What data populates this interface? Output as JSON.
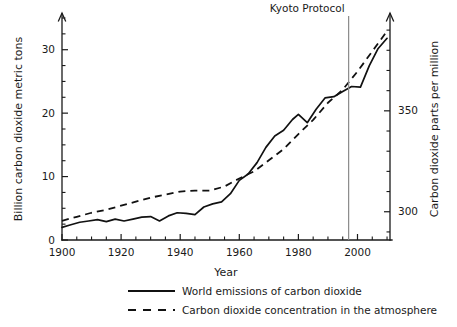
{
  "chart_data": {
    "type": "line",
    "title": "",
    "xlabel": "Year",
    "ylabel": "Billion carbon dioxide metric tons",
    "y2label": "Carbon dioxide parts per million",
    "xlim": [
      1900,
      2011
    ],
    "ylim": [
      0,
      35
    ],
    "y2lim": [
      286,
      396
    ],
    "grid": false,
    "legend_position": "below",
    "x_ticks": [
      1900,
      1920,
      1940,
      1960,
      1980,
      2000
    ],
    "x_tick_labels": [
      "1900",
      "1920",
      "1940",
      "1960",
      "1980",
      "2000"
    ],
    "x_minor_step": 5,
    "y_ticks": [
      0,
      10,
      20,
      30
    ],
    "y_tick_labels": [
      "0",
      "10",
      "20",
      "30"
    ],
    "y_minor_step": 2.5,
    "y2_ticks": [
      300,
      350
    ],
    "y2_tick_labels": [
      "300",
      "350"
    ],
    "y2_minor_step": 10,
    "annotations": [
      {
        "label": "Kyoto Protocol",
        "x": 1997,
        "type": "vertical-line"
      }
    ],
    "series": [
      {
        "name": "World emissions of carbon dioxide",
        "style": "solid",
        "axis": "left",
        "units": "billion metric tons",
        "x": [
          1900,
          1903,
          1906,
          1909,
          1912,
          1915,
          1918,
          1921,
          1924,
          1927,
          1930,
          1933,
          1936,
          1939,
          1942,
          1945,
          1948,
          1951,
          1954,
          1957,
          1960,
          1963,
          1966,
          1969,
          1972,
          1975,
          1978,
          1980,
          1983,
          1986,
          1989,
          1992,
          1995,
          1998,
          2001,
          2004,
          2007,
          2010
        ],
        "values": [
          2.0,
          2.4,
          2.8,
          3.0,
          3.2,
          2.9,
          3.3,
          3.0,
          3.3,
          3.6,
          3.7,
          3.0,
          3.8,
          4.3,
          4.2,
          4.0,
          5.2,
          5.7,
          6.0,
          7.3,
          9.4,
          10.4,
          12.2,
          14.6,
          16.4,
          17.3,
          19.0,
          19.8,
          18.5,
          20.6,
          22.4,
          22.6,
          23.4,
          24.2,
          24.1,
          27.5,
          30.2,
          31.8
        ],
        "notable_points": [
          {
            "x": 1900,
            "y": 2.0,
            "note": "series start"
          },
          {
            "x": 1932,
            "y": 2.9,
            "note": "Great Depression dip"
          },
          {
            "x": 1945,
            "y": 4.0,
            "note": "end of WWII dip"
          },
          {
            "x": 1980,
            "y": 19.8,
            "note": "local peak"
          },
          {
            "x": 1983,
            "y": 18.5,
            "note": "early-1980s dip"
          },
          {
            "x": 2010,
            "y": 31.8,
            "note": "series end"
          }
        ]
      },
      {
        "name": "Carbon dioxide concentration in the atmosphere",
        "style": "dashed",
        "axis": "right",
        "units": "parts per million",
        "x": [
          1900,
          1905,
          1910,
          1915,
          1920,
          1925,
          1930,
          1935,
          1940,
          1945,
          1950,
          1955,
          1960,
          1965,
          1970,
          1975,
          1980,
          1985,
          1990,
          1995,
          2000,
          2005,
          2010
        ],
        "values": [
          295.5,
          297.5,
          299.5,
          301.0,
          303.0,
          305.0,
          307.0,
          308.5,
          310.0,
          310.5,
          310.5,
          312.5,
          316.5,
          320.0,
          325.5,
          331.0,
          338.5,
          345.5,
          354.0,
          360.5,
          369.5,
          379.5,
          389.5
        ],
        "notable_points": [
          {
            "x": 1900,
            "y": 295.5,
            "note": "series start"
          },
          {
            "x": 1945,
            "y": 310.5,
            "note": "mid-century plateau"
          },
          {
            "x": 2010,
            "y": 389.5,
            "note": "series end"
          }
        ]
      }
    ]
  },
  "legend": {
    "items": [
      {
        "label": "World emissions of carbon dioxide",
        "style": "solid"
      },
      {
        "label": "Carbon dioxide concentration in the atmosphere",
        "style": "dashed"
      }
    ]
  }
}
